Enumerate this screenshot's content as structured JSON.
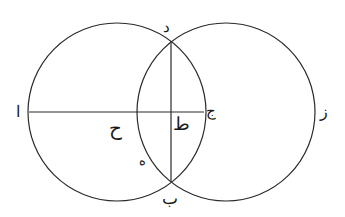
{
  "diagram": {
    "type": "geometric-construction",
    "stroke_color": "#2a2a2a",
    "background": "#ffffff",
    "circles": [
      {
        "name": "left-circle",
        "cx": 117,
        "cy": 112,
        "r": 89
      },
      {
        "name": "right-circle",
        "cx": 226,
        "cy": 112,
        "r": 89
      }
    ],
    "lines": [
      {
        "name": "horizontal-line-alif-jim",
        "x1": 28,
        "y1": 112,
        "x2": 204,
        "y2": 112
      },
      {
        "name": "vertical-chord-dal-ba",
        "x1": 171,
        "y1": 40,
        "x2": 171,
        "y2": 182
      }
    ],
    "labels": {
      "alif": "ا",
      "ba": "ب",
      "jim": "ج",
      "dal": "د",
      "ha": "ه",
      "zay": "ز",
      "hha": "ح",
      "tta": "ط"
    }
  }
}
